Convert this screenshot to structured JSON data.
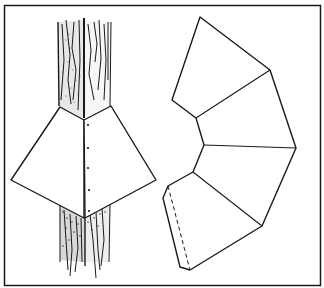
{
  "figure": {
    "colors": {
      "line": "#1a1a1a",
      "background": "#ffffff"
    },
    "left_illustration": {
      "label": "assembled-guard-on-tree",
      "fastener_dots": 5
    },
    "right_illustration": {
      "label": "unfolded-guard-pattern",
      "panels": 4,
      "overlap_flap": "dashed fold line"
    }
  }
}
